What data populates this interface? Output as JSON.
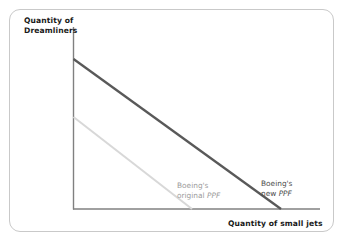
{
  "figure": {
    "name": "boeing-production-possibility-frontier",
    "background_color": "#ffffff",
    "frame_color": "#c9c9c9"
  },
  "axes": {
    "y_title": "Quantity of\nDreamliners",
    "x_title": "Quantity of small jets",
    "axis_color": "#808080",
    "origin": {
      "x": 73,
      "y": 209
    },
    "x_axis_end": {
      "x": 320,
      "y": 209
    },
    "y_axis_top": {
      "x": 73,
      "y": 27
    }
  },
  "labels": {
    "original_ppf": {
      "line1": "Boeing's",
      "line2": "original ",
      "emphasis": "PPF",
      "color": "#9b9b9b"
    },
    "new_ppf": {
      "line1": "Boeing's",
      "line2": "new ",
      "emphasis": "PPF",
      "color": "#4d4d4d"
    }
  },
  "chart_data": {
    "type": "line",
    "title": "",
    "xlabel": "Quantity of small jets",
    "ylabel": "Quantity of Dreamliners",
    "grid": false,
    "legend_position": "inline-annotations",
    "axis_ticks": [],
    "xlim": [
      0,
      100
    ],
    "ylim": [
      0,
      100
    ],
    "series": [
      {
        "name": "Boeing's original PPF",
        "color": "#d8d8d8",
        "width_px": 2.0,
        "x": [
          0,
          100
        ],
        "y": [
          50,
          0
        ],
        "pixel_start": {
          "x": 73,
          "y": 117
        },
        "pixel_end": {
          "x": 192,
          "y": 209
        }
      },
      {
        "name": "Boeing's new PPF",
        "color": "#595959",
        "width_px": 2.3,
        "x": [
          0,
          100
        ],
        "y": [
          100,
          0
        ],
        "pixel_start": {
          "x": 73,
          "y": 59
        },
        "pixel_end": {
          "x": 281,
          "y": 209
        }
      }
    ],
    "annotations": [
      {
        "text": "Boeing's original PPF",
        "x_px": 177,
        "y_px": 181,
        "color": "#9b9b9b"
      },
      {
        "text": "Boeing's new PPF",
        "x_px": 261,
        "y_px": 179,
        "color": "#4d4d4d"
      }
    ]
  }
}
